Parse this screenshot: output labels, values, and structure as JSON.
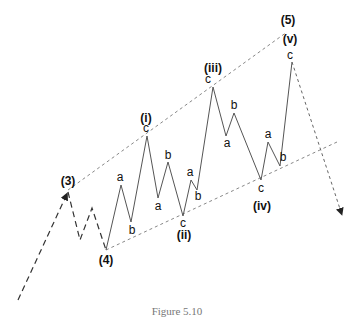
{
  "figure": {
    "caption": "Figure 5.10"
  },
  "colors": {
    "wave_line": "#555555",
    "channel_line": "#888888",
    "dashed_path": "#333333",
    "text": "#111111"
  },
  "labels": {
    "w3": "(3)",
    "w4": "(4)",
    "w5": "(5)",
    "wi": "(i)",
    "wii": "(ii)",
    "wiii": "(iii)",
    "wiv": "(iv)",
    "wv": "(v)",
    "i_a": "a",
    "i_b": "b",
    "i_c": "c",
    "ii_a": "a",
    "ii_b": "b",
    "ii_c": "c",
    "iii_a": "a",
    "iii_b": "b",
    "iii_c": "c",
    "iv_a": "a",
    "iv_b": "b",
    "iv_c": "c",
    "v_a": "a",
    "v_b": "b",
    "v_c": "c"
  }
}
